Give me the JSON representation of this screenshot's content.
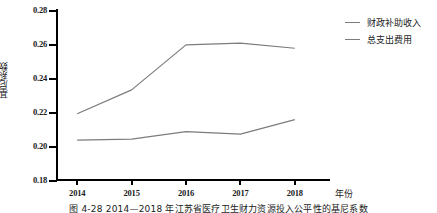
{
  "chart_data": {
    "type": "line",
    "title": "",
    "xlabel": "年份",
    "ylabel": "基尼系数",
    "categories": [
      "2014",
      "2015",
      "2016",
      "2017",
      "2018"
    ],
    "x": [
      2014,
      2015,
      2016,
      2017,
      2018
    ],
    "ylim": [
      0.18,
      0.28
    ],
    "yticks": [
      "0.18",
      "0.20",
      "0.22",
      "0.24",
      "0.26",
      "0.28"
    ],
    "ytick_values": [
      0.18,
      0.2,
      0.22,
      0.24,
      0.26,
      0.28
    ],
    "grid": false,
    "legend_position": "top-right",
    "series": [
      {
        "name": "财政补助收入",
        "color": "#7c7c7c",
        "values": [
          0.219,
          0.233,
          0.2595,
          0.2605,
          0.2575
        ]
      },
      {
        "name": "总支出费用",
        "color": "#7c7c7c",
        "values": [
          0.2035,
          0.204,
          0.2085,
          0.207,
          0.2155
        ]
      }
    ]
  },
  "legend": {
    "items": [
      {
        "label": "财政补助收入"
      },
      {
        "label": "总支出费用"
      }
    ]
  },
  "caption": {
    "text": "图 4-28   2014—2018 年江苏省医疗卫生财力资源投入公平性的基尼系数"
  },
  "colors": {
    "axis": "#000000",
    "line": "#7c7c7c",
    "text": "#1a1a1a",
    "background": "#ffffff"
  }
}
